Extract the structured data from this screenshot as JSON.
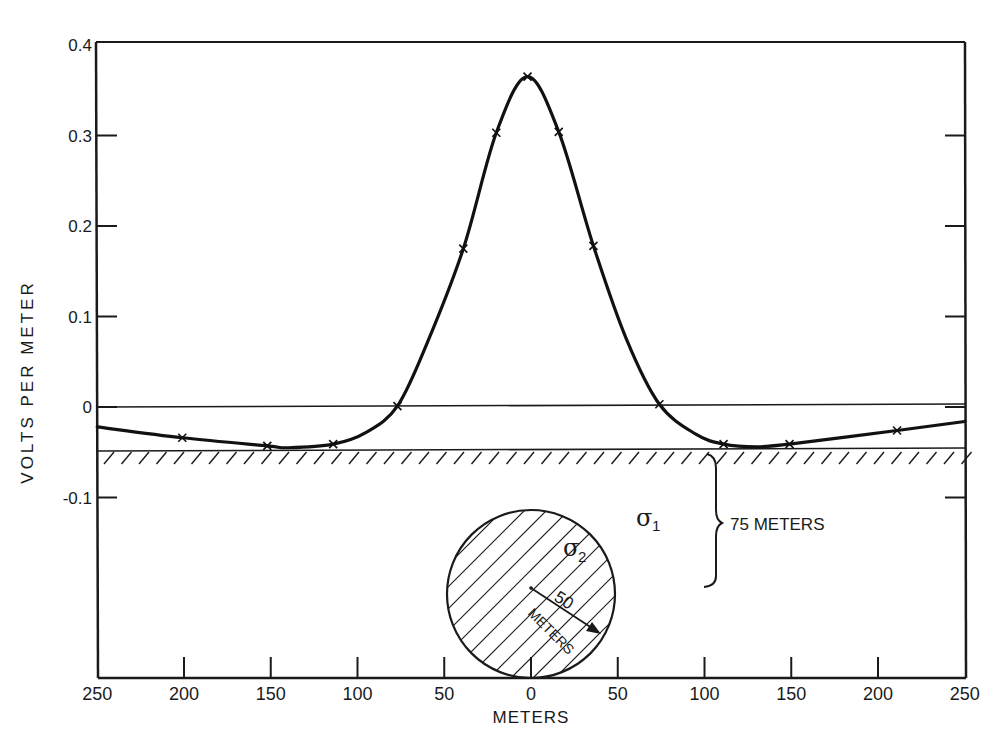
{
  "chart_data": {
    "type": "line",
    "title": "",
    "xlabel": "METERS",
    "ylabel": "VOLTS PER METER",
    "xlim": [
      -250,
      250
    ],
    "ylim": [
      -0.15,
      0.4
    ],
    "grid": false,
    "legend": null,
    "x_tick_labels": [
      "250",
      "200",
      "150",
      "100",
      "50",
      "0",
      "50",
      "100",
      "150",
      "200",
      "250"
    ],
    "x_ticks": [
      -250,
      -200,
      -150,
      -100,
      -50,
      0,
      50,
      100,
      150,
      200,
      250
    ],
    "y_tick_labels": [
      "0.4",
      "0.3",
      "0.2",
      "0.1",
      "0",
      "-0.1"
    ],
    "y_ticks": [
      0.4,
      0.3,
      0.2,
      0.1,
      0,
      -0.1
    ],
    "series": [
      {
        "name": "Measured field (x markers)",
        "marker": "x",
        "x": [
          -201,
          -152,
          -114,
          -77,
          -39,
          -20,
          -2,
          16,
          36,
          74,
          111,
          149,
          211
        ],
        "y": [
          -0.034,
          -0.043,
          -0.041,
          0.001,
          0.175,
          0.303,
          0.365,
          0.304,
          0.178,
          0.003,
          -0.041,
          -0.041,
          -0.026
        ]
      },
      {
        "name": "Smooth curve",
        "x": [
          -250,
          -201,
          -152,
          -140,
          -114,
          -95,
          -77,
          -60,
          -39,
          -20,
          -2,
          16,
          36,
          55,
          74,
          95,
          111,
          130,
          149,
          211,
          250
        ],
        "y": [
          -0.022,
          -0.034,
          -0.043,
          -0.045,
          -0.041,
          -0.028,
          0.001,
          0.07,
          0.175,
          0.303,
          0.365,
          0.304,
          0.178,
          0.075,
          0.003,
          -0.03,
          -0.041,
          -0.044,
          -0.041,
          -0.026,
          -0.016
        ]
      }
    ],
    "reference_lines": [
      {
        "name": "zero-line",
        "y": 0
      }
    ],
    "annotations": {
      "surface_label": "ground surface (hatched) at approx -0.047",
      "sigma1": "σ",
      "sigma1_sub": "1",
      "sigma2": "σ",
      "sigma2_sub": "2",
      "depth_label": "75 METERS",
      "radius_value": "50",
      "radius_unit": "METERS"
    }
  },
  "axes": {
    "xlabel": "METERS",
    "ylabel": "VOLTS PER METER"
  }
}
